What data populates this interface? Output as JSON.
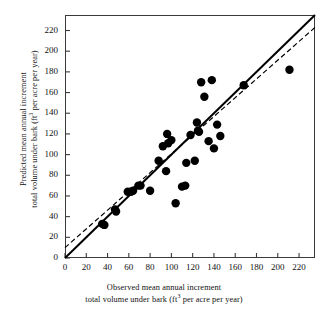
{
  "chart_data": {
    "type": "scatter",
    "title": "",
    "xlabel": "Observed mean annual increment total volume under bark (ft3 per acre per year)",
    "ylabel": "Predicted mean annual increment total volume under bark (ft3 per acre per year)",
    "xlabel_line1": "Observed mean annual increment",
    "xlabel_line2_pre": "total volume under bark (ft",
    "xlabel_sup": "3",
    "xlabel_line2_post": " per acre per year)",
    "ylabel_line1": "Predicted mean annual increment",
    "ylabel_line2_pre": "total volume under bark (ft",
    "ylabel_sup": "3",
    "ylabel_line2_post": " per acre per year)",
    "xlim": [
      0,
      235
    ],
    "ylim": [
      0,
      235
    ],
    "xticks": [
      0,
      20,
      40,
      60,
      80,
      100,
      120,
      140,
      160,
      180,
      200,
      220
    ],
    "yticks": [
      0,
      20,
      40,
      60,
      80,
      100,
      120,
      140,
      160,
      180,
      200,
      220
    ],
    "grid": false,
    "legend": "none",
    "marker": "filled-circle",
    "marker_color": "#000000",
    "marker_size": 4.2,
    "points": [
      {
        "x": 35,
        "y": 33
      },
      {
        "x": 37,
        "y": 32
      },
      {
        "x": 47,
        "y": 47
      },
      {
        "x": 48,
        "y": 45
      },
      {
        "x": 59,
        "y": 64
      },
      {
        "x": 62,
        "y": 64
      },
      {
        "x": 64,
        "y": 65
      },
      {
        "x": 69,
        "y": 70
      },
      {
        "x": 71,
        "y": 70
      },
      {
        "x": 80,
        "y": 65
      },
      {
        "x": 88,
        "y": 94
      },
      {
        "x": 92,
        "y": 108
      },
      {
        "x": 95,
        "y": 84
      },
      {
        "x": 96,
        "y": 120
      },
      {
        "x": 97,
        "y": 111
      },
      {
        "x": 100,
        "y": 114
      },
      {
        "x": 104,
        "y": 53
      },
      {
        "x": 110,
        "y": 69
      },
      {
        "x": 113,
        "y": 70
      },
      {
        "x": 114,
        "y": 92
      },
      {
        "x": 118,
        "y": 119
      },
      {
        "x": 122,
        "y": 94
      },
      {
        "x": 124,
        "y": 131
      },
      {
        "x": 125,
        "y": 123
      },
      {
        "x": 126,
        "y": 122
      },
      {
        "x": 128,
        "y": 170
      },
      {
        "x": 131,
        "y": 156
      },
      {
        "x": 135,
        "y": 113
      },
      {
        "x": 138,
        "y": 172
      },
      {
        "x": 140,
        "y": 106
      },
      {
        "x": 143,
        "y": 129
      },
      {
        "x": 146,
        "y": 118
      },
      {
        "x": 168,
        "y": 167
      },
      {
        "x": 211,
        "y": 182
      }
    ],
    "lines": [
      {
        "name": "one-to-one-line",
        "style": "solid",
        "color": "#000000",
        "width": 2.0,
        "x0": 0,
        "y0": 0,
        "x1": 235,
        "y1": 235
      },
      {
        "name": "regression-line",
        "style": "dashed",
        "color": "#000000",
        "width": 1.2,
        "x0": 0,
        "y0": 10,
        "x1": 235,
        "y1": 223
      }
    ]
  },
  "axes": {
    "y_tick_labels": [
      "220",
      "200",
      "180",
      "160",
      "140",
      "120",
      "100",
      "80",
      "60",
      "40",
      "20",
      "0"
    ],
    "x_tick_labels": [
      "0",
      "20",
      "40",
      "60",
      "80",
      "100",
      "120",
      "140",
      "160",
      "180",
      "200",
      "220"
    ]
  }
}
